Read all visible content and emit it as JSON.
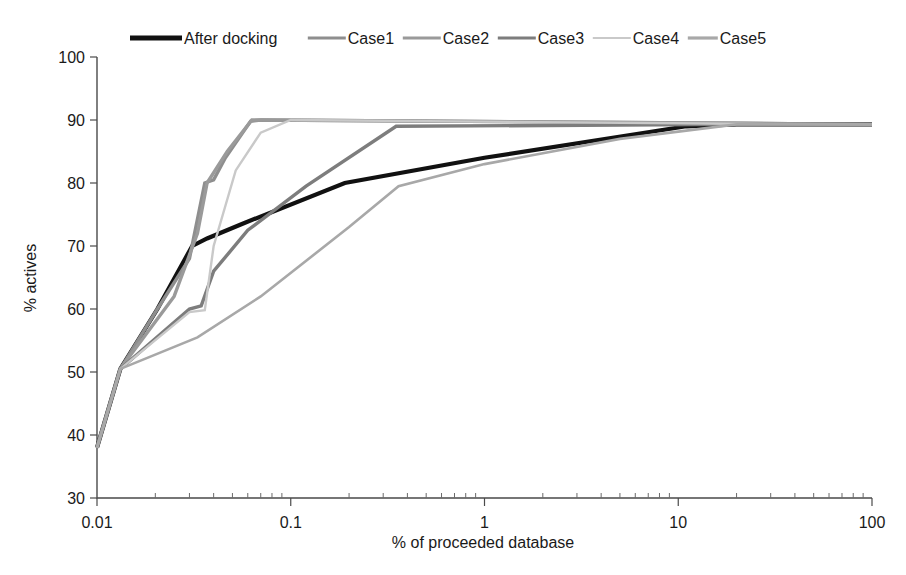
{
  "chart_data": {
    "type": "line",
    "title": "",
    "xlabel": "% of proceeded database",
    "ylabel": "% actives",
    "xscale": "log",
    "xlim": [
      0.01,
      100
    ],
    "ylim": [
      30,
      100
    ],
    "xticks": [
      "0.01",
      "0.1",
      "1",
      "10",
      "100"
    ],
    "xtick_values": [
      0.01,
      0.1,
      1,
      10,
      100
    ],
    "yticks": [
      "30",
      "40",
      "50",
      "60",
      "70",
      "80",
      "90",
      "100"
    ],
    "ytick_values": [
      30,
      40,
      50,
      60,
      70,
      80,
      90,
      100
    ],
    "grid": false,
    "legend_position": "top",
    "series": [
      {
        "name": "After docking",
        "color": "#111111",
        "width": 4.2,
        "x": [
          0.01,
          0.0132,
          0.0205,
          0.031,
          0.037,
          0.056,
          0.19,
          1.0,
          11.0,
          20.0,
          100.0
        ],
        "y": [
          38.0,
          50.5,
          60.0,
          70.0,
          71.2,
          73.5,
          80.0,
          84.0,
          89.0,
          89.3,
          89.3
        ]
      },
      {
        "name": "Case1",
        "color": "#8e8e8e",
        "width": 3.4,
        "x": [
          0.01,
          0.0132,
          0.0205,
          0.03,
          0.036,
          0.04,
          0.046,
          0.062,
          0.07,
          20.0,
          100.0
        ],
        "y": [
          38.0,
          50.5,
          60.0,
          68.0,
          80.0,
          80.5,
          84.0,
          89.8,
          90.0,
          89.5,
          89.3
        ]
      },
      {
        "name": "Case2",
        "color": "#9a9a9a",
        "width": 3.4,
        "x": [
          0.01,
          0.0132,
          0.025,
          0.033,
          0.037,
          0.047,
          0.063,
          0.07,
          20.0,
          100.0
        ],
        "y": [
          38.0,
          50.5,
          62.0,
          72.0,
          80.0,
          85.0,
          90.0,
          90.0,
          89.5,
          89.3
        ]
      },
      {
        "name": "Case3",
        "color": "#7d7d7d",
        "width": 3.4,
        "x": [
          0.01,
          0.0132,
          0.03,
          0.0345,
          0.04,
          0.06,
          0.12,
          0.35,
          20.0,
          100.0
        ],
        "y": [
          38.0,
          50.5,
          60.0,
          60.5,
          66.0,
          72.5,
          79.5,
          89.0,
          89.3,
          89.3
        ]
      },
      {
        "name": "Case4",
        "color": "#c9c9c9",
        "width": 2.4,
        "x": [
          0.01,
          0.0132,
          0.03,
          0.036,
          0.04,
          0.052,
          0.07,
          0.1,
          20.0,
          100.0
        ],
        "y": [
          38.0,
          50.5,
          59.5,
          59.8,
          70.0,
          82.0,
          88.0,
          90.0,
          89.4,
          89.3
        ]
      },
      {
        "name": "Case5",
        "color": "#a8a8a8",
        "width": 2.6,
        "x": [
          0.01,
          0.0132,
          0.033,
          0.07,
          0.2,
          0.36,
          1.0,
          5.0,
          20.0,
          100.0
        ],
        "y": [
          38.0,
          50.5,
          55.5,
          62.0,
          73.0,
          79.5,
          83.0,
          87.0,
          89.3,
          89.3
        ]
      }
    ]
  },
  "legend": {
    "entries": [
      {
        "label": "After docking"
      },
      {
        "label": "Case1"
      },
      {
        "label": "Case2"
      },
      {
        "label": "Case3"
      },
      {
        "label": "Case4"
      },
      {
        "label": "Case5"
      }
    ]
  },
  "axes": {
    "x_title": "% of proceeded database",
    "y_title": "% actives"
  }
}
